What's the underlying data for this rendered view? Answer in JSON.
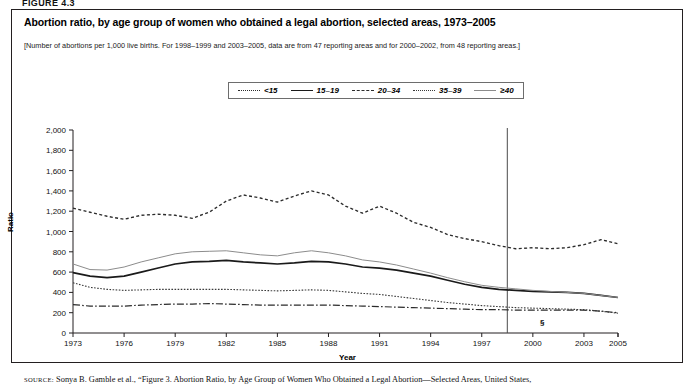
{
  "figure_label": "FIGURE 4.3",
  "title": "Abortion ratio, by age group of women who obtained a legal abortion, selected areas, 1973–2005",
  "subtitle": "[Number of abortions per 1,000 live births. For 1998–1999 and 2003–2005, data are from 47 reporting areas and for 2000–2002, from 48 reporting areas.]",
  "axis": {
    "y_title": "Ratio",
    "x_title": "Year",
    "y_ticks": [
      "0",
      "200",
      "400",
      "600",
      "800",
      "1,000",
      "1,200",
      "1,400",
      "1,600",
      "1,800",
      "2,000"
    ],
    "x_ticks": [
      "1973",
      "1976",
      "1979",
      "1982",
      "1985",
      "1988",
      "1991",
      "1994",
      "1997",
      "2000",
      "2003",
      "2005"
    ]
  },
  "annotation": {
    "section_marker": "§"
  },
  "source": "SOURCE: Sonya B. Gamble et al., “Figure 3. Abortion Ratio, by Age Group of Women Who Obtained a Legal Abortion—Selected Areas, United States,",
  "source_smallcaps": "SOURCE",
  "chart_data": {
    "type": "line",
    "title": "Abortion ratio, by age group of women who obtained a legal abortion, selected areas, 1973–2005",
    "xlabel": "Year",
    "ylabel": "Ratio",
    "xlim": [
      1973,
      2005
    ],
    "ylim": [
      0,
      2000
    ],
    "grid": false,
    "legend_position": "top-center",
    "x": [
      1973,
      1974,
      1975,
      1976,
      1977,
      1978,
      1979,
      1980,
      1981,
      1982,
      1983,
      1984,
      1985,
      1986,
      1987,
      1988,
      1989,
      1990,
      1991,
      1992,
      1993,
      1994,
      1995,
      1996,
      1997,
      1998,
      1999,
      2000,
      2001,
      2002,
      2003,
      2004,
      2005
    ],
    "series": [
      {
        "name": "<15",
        "style": "dotted",
        "color": "#2b2b2b",
        "values": [
          1230,
          1190,
          1150,
          1120,
          1160,
          1170,
          1160,
          1130,
          1190,
          1300,
          1360,
          1330,
          1290,
          1350,
          1400,
          1360,
          1250,
          1180,
          1250,
          1180,
          1090,
          1040,
          970,
          930,
          900,
          860,
          830,
          840,
          830,
          840,
          870,
          920,
          880
        ]
      },
      {
        "name": "15–19",
        "style": "solid-bold",
        "color": "#1a1a1a",
        "values": [
          595,
          560,
          545,
          560,
          600,
          640,
          680,
          700,
          705,
          715,
          700,
          690,
          680,
          690,
          705,
          700,
          680,
          650,
          640,
          620,
          590,
          560,
          520,
          480,
          450,
          430,
          420,
          410,
          405,
          400,
          390,
          370,
          350
        ]
      },
      {
        "name": "20–34",
        "style": "dashdot",
        "color": "#2b2b2b",
        "values": [
          280,
          265,
          265,
          265,
          275,
          280,
          285,
          285,
          290,
          285,
          280,
          275,
          275,
          275,
          275,
          275,
          270,
          265,
          260,
          255,
          250,
          245,
          240,
          235,
          230,
          230,
          225,
          225,
          225,
          225,
          225,
          215,
          200
        ]
      },
      {
        "name": "35–39",
        "style": "fine-dotted",
        "color": "#3a3a3a",
        "values": [
          495,
          450,
          430,
          420,
          425,
          430,
          430,
          430,
          430,
          430,
          425,
          420,
          415,
          420,
          425,
          420,
          405,
          390,
          380,
          360,
          340,
          320,
          300,
          285,
          270,
          260,
          250,
          245,
          240,
          235,
          230,
          215,
          195
        ]
      },
      {
        "name": "≥40",
        "style": "thin-solid",
        "color": "#8c8c8c",
        "values": [
          680,
          625,
          620,
          650,
          700,
          740,
          780,
          800,
          805,
          810,
          790,
          770,
          760,
          790,
          810,
          790,
          760,
          720,
          700,
          670,
          630,
          590,
          545,
          505,
          470,
          450,
          435,
          420,
          410,
          400,
          390,
          370,
          350
        ]
      }
    ],
    "vertical_marker": {
      "x": 1998.5,
      "label": "§"
    }
  },
  "legend": {
    "items": [
      {
        "label": "<15",
        "sym": "s-lt15"
      },
      {
        "label": "15–19",
        "sym": "s-1519"
      },
      {
        "label": "20–34",
        "sym": "s-2034"
      },
      {
        "label": "35–39",
        "sym": "s-3539"
      },
      {
        "label": "≥40",
        "sym": "s-40"
      }
    ]
  }
}
